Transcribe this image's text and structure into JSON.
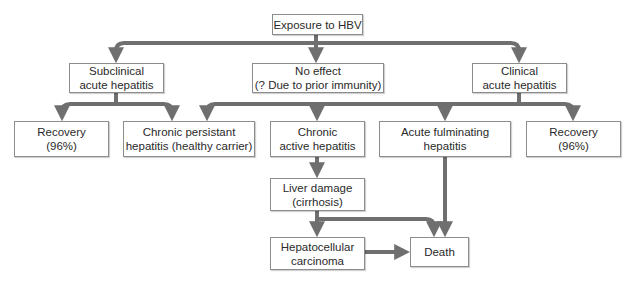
{
  "diagram": {
    "colors": {
      "connector": "#6f6f6f",
      "box_border": "#8c8c8c",
      "text": "#2a2a2a",
      "background": "#ffffff"
    },
    "nodes": {
      "exposure": {
        "line1": "Exposure to HBV"
      },
      "subclinical": {
        "line1": "Subclinical",
        "line2": "acute hepatitis"
      },
      "no_effect": {
        "line1": "No effect",
        "line2": "(? Due to prior immunity)"
      },
      "clinical": {
        "line1": "Clinical",
        "line2": "acute hepatitis"
      },
      "recovery_left": {
        "line1": "Recovery",
        "line2": "(96%)"
      },
      "chronic_persistent": {
        "line1": "Chronic persistant",
        "line2": "hepatitis (healthy carrier)"
      },
      "chronic_active": {
        "line1": "Chronic",
        "line2": "active hepatitis"
      },
      "acute_fulminating": {
        "line1": "Acute fulminating",
        "line2": "hepatitis"
      },
      "recovery_right": {
        "line1": "Recovery",
        "line2": "(96%)"
      },
      "liver_damage": {
        "line1": "Liver damage",
        "line2": "(cirrhosis)"
      },
      "hepatocellular": {
        "line1": "Hepatocellular",
        "line2": "carcinoma"
      },
      "death": {
        "line1": "Death"
      }
    },
    "edges": [
      {
        "from": "exposure",
        "to": "subclinical"
      },
      {
        "from": "exposure",
        "to": "no_effect"
      },
      {
        "from": "exposure",
        "to": "clinical"
      },
      {
        "from": "subclinical",
        "to": "recovery_left"
      },
      {
        "from": "subclinical",
        "to": "chronic_persistent"
      },
      {
        "from": "clinical",
        "to": "chronic_persistent"
      },
      {
        "from": "clinical",
        "to": "chronic_active"
      },
      {
        "from": "clinical",
        "to": "acute_fulminating"
      },
      {
        "from": "clinical",
        "to": "recovery_right"
      },
      {
        "from": "chronic_active",
        "to": "liver_damage"
      },
      {
        "from": "liver_damage",
        "to": "hepatocellular"
      },
      {
        "from": "liver_damage",
        "to": "death"
      },
      {
        "from": "acute_fulminating",
        "to": "death"
      },
      {
        "from": "hepatocellular",
        "to": "death"
      }
    ]
  }
}
